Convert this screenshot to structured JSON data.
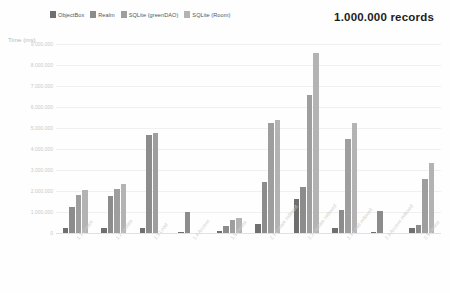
{
  "title": "1.000.000 records",
  "axis_label": "Time (ms)",
  "legend": [
    {
      "label": "ObjectBox",
      "color": "#6f6f6f"
    },
    {
      "label": "Realm",
      "color": "#8c8c8c"
    },
    {
      "label": "SQLite (greenDAO)",
      "color": "#9e9e9e"
    },
    {
      "label": "SQLite (Room)",
      "color": "#b3b3b3"
    }
  ],
  "yticks": [
    "0",
    "1.000.000",
    "2.000.000",
    "3.000.000",
    "4.000.000",
    "5.000.000",
    "6.000.000",
    "7.000.000",
    "8.000.000",
    "9.000.000"
  ],
  "chart_data": {
    "type": "bar",
    "title": "1.000.000 records",
    "xlabel": "",
    "ylabel": "Time (ms)",
    "ylim": [
      0,
      9000000
    ],
    "ystep": 1000000,
    "grid": true,
    "legend_position": "top-left",
    "categories": [
      "1.1 Create",
      "1.2 Update",
      "1.3 Load",
      "1.4 Access",
      "1.5 Delete",
      "2.1 Create indexed",
      "2.2 Update indexed",
      "2.3 Load indexed",
      "2.4 Access indexed",
      "2.5 Delete"
    ],
    "series": [
      {
        "name": "ObjectBox",
        "color": "#6f6f6f",
        "values": [
          230000,
          250000,
          230000,
          60000,
          90000,
          420000,
          1600000,
          220000,
          60000,
          230000
        ]
      },
      {
        "name": "Realm",
        "color": "#8c8c8c",
        "values": [
          1250000,
          1750000,
          4650000,
          1000000,
          330000,
          2450000,
          2200000,
          1100000,
          1050000,
          370000
        ]
      },
      {
        "name": "SQLite (greenDAO)",
        "color": "#9e9e9e",
        "values": [
          1800000,
          2100000,
          4750000,
          0,
          600000,
          5250000,
          6550000,
          4500000,
          0,
          2550000
        ]
      },
      {
        "name": "SQLite (Room)",
        "color": "#b3b3b3",
        "values": [
          2050000,
          2350000,
          0,
          0,
          720000,
          5400000,
          8550000,
          5250000,
          0,
          3350000
        ]
      }
    ]
  }
}
